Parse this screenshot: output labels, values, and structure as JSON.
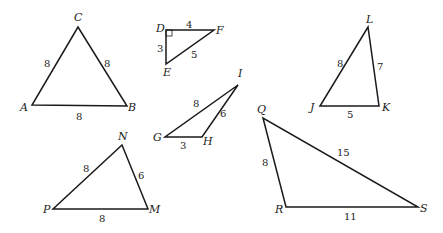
{
  "diagram": {
    "type": "triangle-set",
    "triangles": [
      {
        "name": "ABC",
        "vertices": {
          "A": [
            32,
            105
          ],
          "B": [
            127,
            106
          ],
          "C": [
            78,
            27
          ]
        },
        "vertex_labels": [
          {
            "text": "C",
            "x": 74,
            "y": 21
          },
          {
            "text": "A",
            "x": 20,
            "y": 111
          },
          {
            "text": "B",
            "x": 128,
            "y": 111
          }
        ],
        "side_labels": [
          {
            "text": "8",
            "x": 44,
            "y": 67,
            "side": "AC"
          },
          {
            "text": "8",
            "x": 104,
            "y": 67,
            "side": "BC"
          },
          {
            "text": "8",
            "x": 76,
            "y": 120,
            "side": "AB"
          }
        ]
      },
      {
        "name": "DEF",
        "vertices": {
          "D": [
            166,
            30
          ],
          "F": [
            214,
            30
          ],
          "E": [
            166,
            64
          ]
        },
        "right_angle_at": "D",
        "vertex_labels": [
          {
            "text": "D",
            "x": 156,
            "y": 32
          },
          {
            "text": "F",
            "x": 216,
            "y": 34
          },
          {
            "text": "E",
            "x": 163,
            "y": 76
          }
        ],
        "side_labels": [
          {
            "text": "4",
            "x": 186,
            "y": 28,
            "side": "DF"
          },
          {
            "text": "3",
            "x": 157,
            "y": 52,
            "side": "DE"
          },
          {
            "text": "5",
            "x": 191,
            "y": 58,
            "side": "EF"
          }
        ]
      },
      {
        "name": "GHI",
        "vertices": {
          "G": [
            165,
            137
          ],
          "H": [
            202,
            137
          ],
          "I": [
            238,
            85
          ]
        },
        "vertex_labels": [
          {
            "text": "I",
            "x": 238,
            "y": 77
          },
          {
            "text": "G",
            "x": 153,
            "y": 141
          },
          {
            "text": "H",
            "x": 203,
            "y": 145
          }
        ],
        "side_labels": [
          {
            "text": "8",
            "x": 193,
            "y": 107,
            "side": "GI"
          },
          {
            "text": "6",
            "x": 220,
            "y": 117,
            "side": "HI"
          },
          {
            "text": "3",
            "x": 180,
            "y": 149,
            "side": "GH"
          }
        ]
      },
      {
        "name": "JKL",
        "vertices": {
          "J": [
            320,
            106
          ],
          "K": [
            379,
            106
          ],
          "L": [
            368,
            27
          ]
        },
        "vertex_labels": [
          {
            "text": "L",
            "x": 366,
            "y": 23
          },
          {
            "text": "J",
            "x": 310,
            "y": 111
          },
          {
            "text": "K",
            "x": 382,
            "y": 111
          }
        ],
        "side_labels": [
          {
            "text": "8",
            "x": 337,
            "y": 67,
            "side": "JL"
          },
          {
            "text": "7",
            "x": 377,
            "y": 70,
            "side": "KL"
          },
          {
            "text": "5",
            "x": 347,
            "y": 118,
            "side": "JK"
          }
        ]
      },
      {
        "name": "NMP",
        "vertices": {
          "N": [
            122,
            145
          ],
          "M": [
            148,
            209
          ],
          "P": [
            53,
            209
          ]
        },
        "vertex_labels": [
          {
            "text": "N",
            "x": 118,
            "y": 140
          },
          {
            "text": "M",
            "x": 149,
            "y": 213
          },
          {
            "text": "P",
            "x": 43,
            "y": 213
          }
        ],
        "side_labels": [
          {
            "text": "8",
            "x": 83,
            "y": 172,
            "side": "NP"
          },
          {
            "text": "6",
            "x": 138,
            "y": 179,
            "side": "MN"
          },
          {
            "text": "8",
            "x": 99,
            "y": 222,
            "side": "PM"
          }
        ]
      },
      {
        "name": "QRS",
        "vertices": {
          "Q": [
            263,
            118
          ],
          "R": [
            286,
            207
          ],
          "S": [
            418,
            207
          ]
        },
        "vertex_labels": [
          {
            "text": "Q",
            "x": 257,
            "y": 113
          },
          {
            "text": "R",
            "x": 275,
            "y": 213
          },
          {
            "text": "S",
            "x": 420,
            "y": 212
          }
        ],
        "side_labels": [
          {
            "text": "15",
            "x": 337,
            "y": 156,
            "side": "QS"
          },
          {
            "text": "8",
            "x": 262,
            "y": 166,
            "side": "QR"
          },
          {
            "text": "11",
            "x": 344,
            "y": 220,
            "side": "RS"
          }
        ]
      }
    ]
  }
}
